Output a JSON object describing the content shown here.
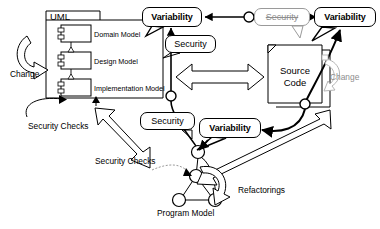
{
  "diagram": {
    "colors": {
      "ink": "#000000",
      "gray": "#8d8d8d",
      "paper": "#ffffff"
    },
    "uml_package": {
      "name": "UML",
      "components": [
        {
          "label": "Domain Model"
        },
        {
          "label": "Design Model"
        },
        {
          "label": "Implementation Model"
        }
      ]
    },
    "source_code": {
      "line1": "Source",
      "line2": "Code"
    },
    "program_model": {
      "label": "Program Model"
    },
    "callouts": [
      {
        "id": "variability-top-left",
        "label": "Variability",
        "style": "bold"
      },
      {
        "id": "security-top-left",
        "label": "Security",
        "style": "regular"
      },
      {
        "id": "security-top-right",
        "label": "Security",
        "style": "struck"
      },
      {
        "id": "variability-top-right",
        "label": "Variability",
        "style": "bold"
      },
      {
        "id": "security-middle",
        "label": "Security",
        "style": "regular"
      },
      {
        "id": "variability-middle",
        "label": "Variability",
        "style": "bold"
      }
    ],
    "annotations": [
      {
        "id": "change-left",
        "label": "Change"
      },
      {
        "id": "change-right",
        "label": "Change"
      },
      {
        "id": "security-checks-uml",
        "label": "Security Checks"
      },
      {
        "id": "security-checks-center",
        "label": "Security Checks"
      },
      {
        "id": "refactorings",
        "label": "Refactorings"
      }
    ]
  }
}
